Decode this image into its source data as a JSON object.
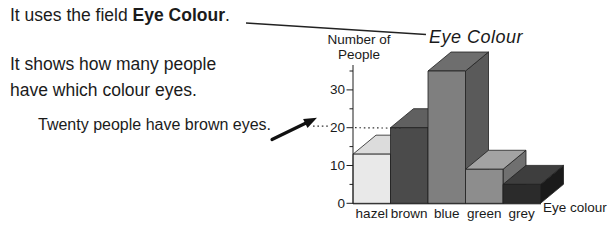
{
  "annotations": {
    "line1_prefix": "It uses the field ",
    "line1_bold": "Eye Colour",
    "line1_suffix": ".",
    "line2a": "It shows how many people",
    "line2b": "have which colour eyes.",
    "callout": "Twenty people have brown eyes."
  },
  "chart_data": {
    "type": "bar",
    "style": "3d-grayscale",
    "title": "Eye Colour",
    "ylabel": [
      "Number of",
      "People"
    ],
    "xlabel": "Eye colour",
    "categories": [
      "hazel",
      "brown",
      "blue",
      "green",
      "grey"
    ],
    "values": [
      13,
      20,
      35,
      9,
      5
    ],
    "yticks": [
      0,
      10,
      20,
      30
    ],
    "minor_ticks": [
      5,
      15,
      25,
      35
    ],
    "ylim": [
      0,
      38
    ],
    "grid": false,
    "legend": "none",
    "dotted_reference_value": 20,
    "bar_colors": [
      {
        "front": "#e9e9e9",
        "top": "#dcdcdc",
        "side": "#c8c8c8"
      },
      {
        "front": "#4b4b4b",
        "top": "#606060",
        "side": "#3a3a3a"
      },
      {
        "front": "#7f7f7f",
        "top": "#6e6e6e",
        "side": "#5a5a5a"
      },
      {
        "front": "#8d8d8d",
        "top": "#a3a3a3",
        "side": "#707070"
      },
      {
        "front": "#2b2b2b",
        "top": "#3e3e3e",
        "side": "#1a1a1a"
      }
    ]
  }
}
